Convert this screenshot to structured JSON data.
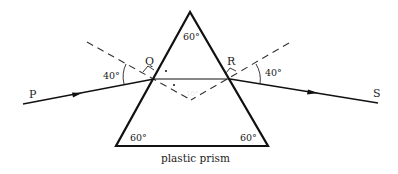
{
  "diagram": {
    "caption": "plastic prism",
    "apex_angle": "60°",
    "bottom_left_angle": "60°",
    "bottom_right_angle": "60°",
    "incidence_angle": "40°",
    "emergence_angle": "40°",
    "points": {
      "P": "P",
      "Q": "Q",
      "R": "R",
      "S": "S"
    },
    "faint_label": "10°",
    "colors": {
      "line": "#111111",
      "dashed": "#333333",
      "background": "#ffffff"
    }
  }
}
